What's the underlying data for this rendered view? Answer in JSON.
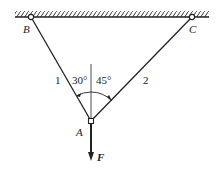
{
  "diagram": {
    "type": "truss-statics",
    "points": {
      "B": {
        "label": "B",
        "x": 31,
        "y": 17
      },
      "C": {
        "label": "C",
        "x": 192,
        "y": 17
      },
      "A": {
        "label": "A",
        "x": 91,
        "y": 121
      }
    },
    "members": [
      {
        "label": "1",
        "from": "B",
        "to": "A"
      },
      {
        "label": "2",
        "from": "C",
        "to": "A"
      }
    ],
    "angles": [
      {
        "label": "30°",
        "between": "member 1 and vertical"
      },
      {
        "label": "45°",
        "between": "vertical and member 2"
      }
    ],
    "force": {
      "label": "F",
      "direction": "down"
    },
    "colors": {
      "line": "#222222",
      "background": "#ffffff"
    }
  }
}
